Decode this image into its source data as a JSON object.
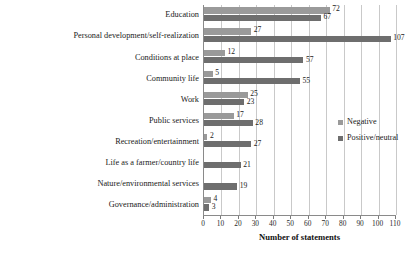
{
  "chart_data": {
    "type": "bar",
    "orientation": "horizontal",
    "title": "",
    "xlabel": "Number of statements",
    "ylabel": "",
    "xlim": [
      0,
      110
    ],
    "xticks": [
      0,
      10,
      20,
      30,
      40,
      50,
      60,
      70,
      80,
      90,
      100,
      110
    ],
    "grid": true,
    "legend_position": "right",
    "categories": [
      "Education",
      "Personal development/self-realization",
      "Conditions at place",
      "Community life",
      "Work",
      "Public services",
      "Recreation/entertainment",
      "Life as a farmer/country life",
      "Nature/environmental services",
      "Governance/administration"
    ],
    "series": [
      {
        "name": "Negative",
        "color": "#9a9a9a",
        "values": [
          72,
          27,
          12,
          5,
          25,
          17,
          2,
          0,
          0,
          4
        ],
        "labels": [
          "72",
          "27",
          "12",
          "5",
          "25",
          "17",
          "2",
          "",
          "",
          "4"
        ]
      },
      {
        "name": "Positive/neutral",
        "color": "#6e6e6e",
        "values": [
          67,
          107,
          57,
          55,
          23,
          28,
          27,
          21,
          19,
          3
        ],
        "labels": [
          "67",
          "107",
          "57",
          "55",
          "23",
          "28",
          "27",
          "21",
          "19",
          "3"
        ]
      }
    ]
  },
  "axis": {
    "x_title": "Number of statements"
  },
  "legend": {
    "items": [
      {
        "label": "Negative",
        "color": "#9a9a9a"
      },
      {
        "label": "Positive/neutral",
        "color": "#6e6e6e"
      }
    ]
  }
}
